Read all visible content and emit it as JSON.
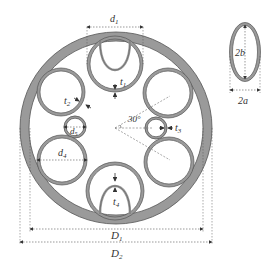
{
  "diagram": {
    "colors": {
      "wall_fill": "#9a9a9a",
      "wall_stroke": "#555555",
      "dim_line": "#555555",
      "text": "#333333"
    },
    "outer_ring": {
      "cx": 116,
      "cy": 128,
      "r_outer": 96,
      "r_inner": 87
    },
    "tubes": [
      {
        "id": "top-tube",
        "cx": 115,
        "cy": 64,
        "r": 28
      },
      {
        "id": "upper-left-tube",
        "cx": 61,
        "cy": 92,
        "r": 24
      },
      {
        "id": "small-left-tube",
        "cx": 75,
        "cy": 127,
        "r": 11
      },
      {
        "id": "lower-left-tube",
        "cx": 62,
        "cy": 160,
        "r": 25
      },
      {
        "id": "bottom-tube",
        "cx": 115,
        "cy": 191,
        "r": 29
      },
      {
        "id": "upper-right-tube",
        "cx": 168,
        "cy": 93,
        "r": 25
      },
      {
        "id": "small-right-tube",
        "cx": 156,
        "cy": 128,
        "r": 11
      },
      {
        "id": "lower-right-tube",
        "cx": 169,
        "cy": 162,
        "r": 25
      }
    ],
    "ellipse": {
      "cx": 245,
      "cy": 52,
      "rx": 15,
      "ry": 29
    },
    "labels": {
      "d1": "d",
      "d1_sub": "1",
      "d4": "d",
      "d4_sub": "4",
      "d5": "d",
      "d5_sub": "5",
      "t1": "t",
      "t1_sub": "1",
      "t2": "t",
      "t2_sub": "2",
      "t3": "t",
      "t3_sub": "3",
      "t4": "t",
      "t4_sub": "4",
      "angle": "30°",
      "D1": "D",
      "D1_sub": "1",
      "D2": "D",
      "D2_sub": "2",
      "two_b": "2b",
      "two_a": "2a"
    }
  }
}
